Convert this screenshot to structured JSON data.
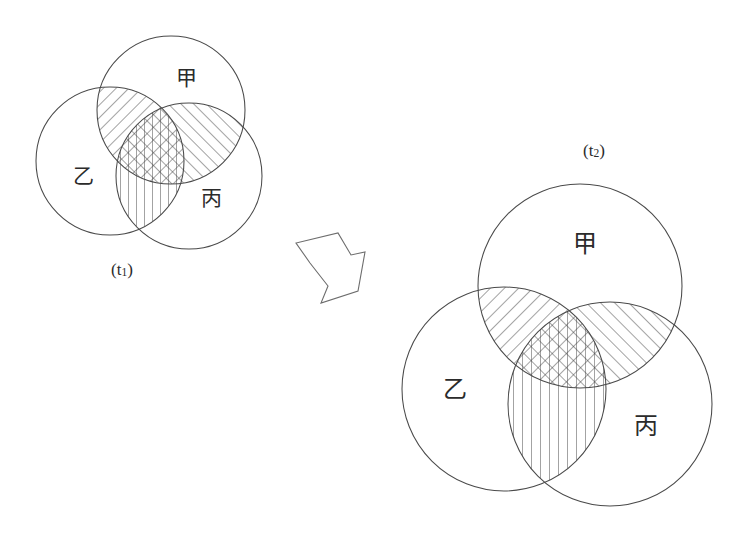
{
  "figure": {
    "type": "venn-diagram-pair",
    "background": "#ffffff",
    "stroke_color": "#4a4a4a",
    "hatch_color": "#3c3c3c",
    "arrow_color": "#6d6d6d",
    "width": 750,
    "height": 547
  },
  "panels": [
    {
      "id": "t1",
      "name": "left-panel",
      "time_label": "(t",
      "time_sub": "1",
      "time_close": ")",
      "time_label_full": "(t1)",
      "label_x": 122,
      "label_y": 271,
      "sets": [
        {
          "key": "jia",
          "label": "甲",
          "cx": 171,
          "cy": 110,
          "r": 74,
          "label_x": 186,
          "label_y": 79
        },
        {
          "key": "yi",
          "label": "乙",
          "cx": 110,
          "cy": 161,
          "r": 74,
          "label_x": 83,
          "label_y": 177
        },
        {
          "key": "bing",
          "label": "丙",
          "cx": 189,
          "cy": 176,
          "r": 73,
          "label_x": 211,
          "label_y": 199
        }
      ],
      "hatches": [
        {
          "region": "jia-yi",
          "pattern": "diag-down",
          "note": "甲∩乙"
        },
        {
          "region": "jia-bing",
          "pattern": "diag-up",
          "note": "甲∩丙"
        },
        {
          "region": "yi-bing",
          "pattern": "vertical",
          "note": "乙∩丙"
        }
      ]
    },
    {
      "id": "t2",
      "name": "right-panel",
      "time_label": "(t",
      "time_sub": "2",
      "time_close": ")",
      "time_label_full": "(t2)",
      "label_x": 594,
      "label_y": 152,
      "sets": [
        {
          "key": "jia",
          "label": "甲",
          "cx": 580,
          "cy": 286,
          "r": 102,
          "label_x": 585,
          "label_y": 245
        },
        {
          "key": "yi",
          "label": "乙",
          "cx": 504,
          "cy": 389,
          "r": 102,
          "label_x": 455,
          "label_y": 390
        },
        {
          "key": "bing",
          "label": "丙",
          "cx": 610,
          "cy": 404,
          "r": 102,
          "label_x": 646,
          "label_y": 427
        }
      ],
      "hatches": [
        {
          "region": "jia-yi",
          "pattern": "diag-down",
          "note": "甲∩乙"
        },
        {
          "region": "jia-bing",
          "pattern": "diag-up",
          "note": "甲∩丙"
        },
        {
          "region": "yi-bing",
          "pattern": "vertical",
          "note": "乙∩丙"
        }
      ]
    }
  ],
  "arrow": {
    "name": "transition-arrow",
    "direction": "down-right",
    "points": "310,263 296,243 338,233 351,255 365,252 358,291 321,303 328,286"
  },
  "set_labels": {
    "jia": "甲",
    "yi": "乙",
    "bing": "丙"
  },
  "font_sizes": {
    "venn_label_left": 21,
    "venn_label_right": 24,
    "time_label_left": 17,
    "time_label_right": 17
  }
}
